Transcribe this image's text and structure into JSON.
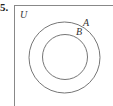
{
  "problem": {
    "number": "5."
  },
  "diagram": {
    "type": "venn",
    "universe_label": "U",
    "sets": [
      {
        "label": "A",
        "role": "outer"
      },
      {
        "label": "B",
        "role": "inner",
        "subset_of": "A"
      }
    ],
    "colors": {
      "stroke": "#666666",
      "border": "#888888",
      "text": "#333333"
    }
  }
}
